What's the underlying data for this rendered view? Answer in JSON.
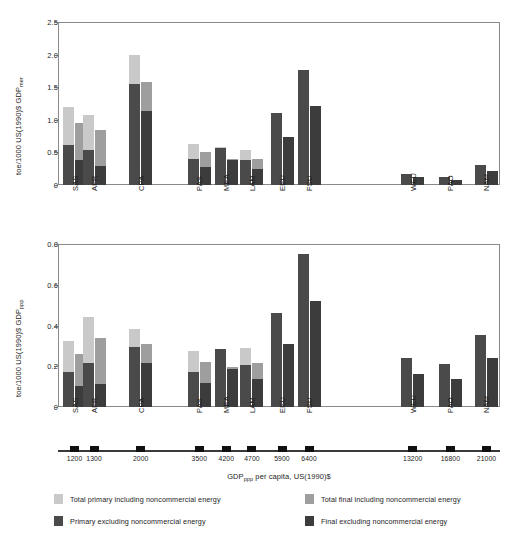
{
  "chart_data": {
    "type": "bar",
    "title": "",
    "xlabel": "GDPppp per capita, US(1990)$",
    "xlabel_parts": {
      "prefix": "GDP",
      "sub": "ppp",
      "suffix": " per capita, US(1990)$"
    },
    "grid": false,
    "legend_position": "bottom",
    "categories": [
      "SAS",
      "AFR",
      "CPA",
      "PAS",
      "MEA",
      "LAM",
      "EEU",
      "FSU",
      "WEU",
      "PAO",
      "NAM"
    ],
    "x": [
      1200,
      1300,
      2000,
      3500,
      4200,
      4700,
      5900,
      6400,
      13200,
      16800,
      21000
    ],
    "x_tick_labels": [
      "1200",
      "1300",
      "2000",
      "3500",
      "4200",
      "4700",
      "5900",
      "6400",
      "13200",
      "16800",
      "21000"
    ],
    "panels": [
      {
        "name": "mer-panel",
        "ylabel": "toe/1000 US(1990)$ GDPmer",
        "ylabel_parts": {
          "prefix": "toe/1000 US(1990)$ GDP",
          "sub": "mer"
        },
        "ylim": [
          0,
          2.5
        ],
        "y_tick_labels": [
          "0",
          "0.5",
          "1.0",
          "1.5",
          "2.0",
          "2.5"
        ],
        "y_ticks": [
          0,
          0.5,
          1.0,
          1.5,
          2.0,
          2.5
        ],
        "series": [
          {
            "name": "Total primary including noncommercial energy",
            "key": "total_primary",
            "values": [
              1.19,
              1.08,
              1.99,
              0.63,
              0.58,
              0.54,
              1.11,
              1.76,
              0.17,
              0.13,
              0.31
            ]
          },
          {
            "name": "Primary excluding noncommercial energy",
            "key": "primary_excl",
            "values": [
              0.62,
              0.53,
              1.55,
              0.4,
              0.56,
              0.38,
              1.11,
              1.76,
              0.17,
              0.13,
              0.31
            ]
          },
          {
            "name": "Total final including noncommercial energy",
            "key": "total_final",
            "values": [
              0.95,
              0.84,
              1.58,
              0.51,
              0.4,
              0.4,
              0.74,
              1.21,
              0.12,
              0.08,
              0.21
            ]
          },
          {
            "name": "Final excluding noncommercial energy",
            "key": "final_excl",
            "values": [
              0.39,
              0.29,
              1.14,
              0.28,
              0.38,
              0.25,
              0.74,
              1.21,
              0.12,
              0.08,
              0.21
            ]
          }
        ]
      },
      {
        "name": "ppp-panel",
        "ylabel": "toe/1000 US(1990)$ GDPppp",
        "ylabel_parts": {
          "prefix": "toe/1000 US(1990)$ GDP",
          "sub": "ppp"
        },
        "ylim": [
          0,
          0.8
        ],
        "y_tick_labels": [
          "0",
          "0.2",
          "0.4",
          "0.6",
          "0.8"
        ],
        "y_ticks": [
          0,
          0.2,
          0.4,
          0.6,
          0.8
        ],
        "series": [
          {
            "name": "Total primary including noncommercial energy",
            "key": "total_primary",
            "values": [
              0.325,
              0.44,
              0.385,
              0.275,
              0.285,
              0.29,
              0.46,
              0.75,
              0.24,
              0.21,
              0.355
            ]
          },
          {
            "name": "Primary excluding noncommercial energy",
            "key": "primary_excl",
            "values": [
              0.17,
              0.215,
              0.295,
              0.17,
              0.285,
              0.205,
              0.46,
              0.75,
              0.24,
              0.21,
              0.355
            ]
          },
          {
            "name": "Total final including noncommercial energy",
            "key": "total_final",
            "values": [
              0.26,
              0.34,
              0.31,
              0.22,
              0.195,
              0.215,
              0.31,
              0.52,
              0.16,
              0.135,
              0.24
            ]
          },
          {
            "name": "Final excluding noncommercial energy",
            "key": "final_excl",
            "values": [
              0.105,
              0.115,
              0.215,
              0.12,
              0.185,
              0.135,
              0.31,
              0.52,
              0.16,
              0.135,
              0.24
            ]
          }
        ]
      }
    ],
    "legend": [
      {
        "label": "Total primary including noncommercial energy",
        "color": "#c9c9c9"
      },
      {
        "label": "Total final including noncommercial energy",
        "color": "#9e9e9e"
      },
      {
        "label": "Primary excluding noncommercial energy",
        "color": "#4a4a4a"
      },
      {
        "label": "Final excluding noncommercial energy",
        "color": "#3c3c3c"
      }
    ],
    "colors": {
      "total_primary": "#c9c9c9",
      "primary_excl": "#4a4a4a",
      "total_final": "#9e9e9e",
      "final_excl": "#3c3c3c",
      "axis": "#6f6f6f",
      "text": "#1d1d1d"
    }
  }
}
